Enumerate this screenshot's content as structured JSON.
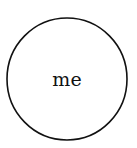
{
  "diagram": {
    "nodes": [
      {
        "id": "me",
        "label": "me",
        "shape": "circle",
        "cx": 67,
        "cy": 79,
        "rx": 60,
        "ry": 61,
        "stroke": "#111111",
        "fill": "#ffffff"
      }
    ],
    "edges": []
  }
}
